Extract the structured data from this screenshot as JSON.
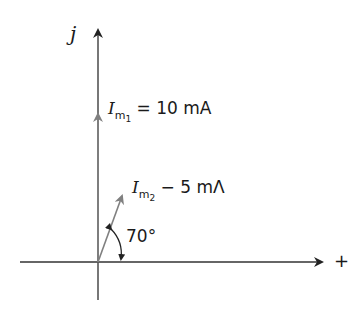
{
  "diagram": {
    "type": "phasor",
    "axes": {
      "vertical_label": "j",
      "horizontal_label": "+"
    },
    "phasors": [
      {
        "name": "I_m1",
        "symbol": "I",
        "subscript_main": "m",
        "subscript_index": "1",
        "value_text": "= 10 mA",
        "magnitude": 10,
        "unit": "mA",
        "angle_deg": 90
      },
      {
        "name": "I_m2",
        "symbol": "I",
        "subscript_main": "m",
        "subscript_index": "2",
        "value_text": "− 5 mΛ",
        "magnitude": 5,
        "unit": "mA",
        "angle_deg": 70
      }
    ],
    "angle_annotation": "70°",
    "colors": {
      "axis": "#333333",
      "phasor": "#808080"
    }
  }
}
